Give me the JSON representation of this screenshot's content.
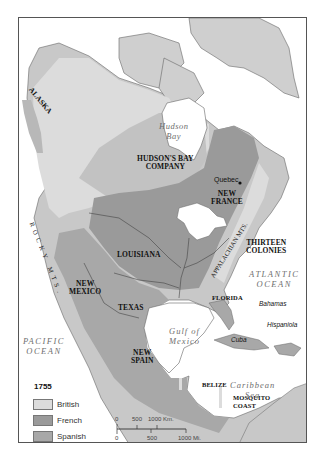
{
  "map": {
    "year": "1755",
    "colors": {
      "water": "#ffffff",
      "british": "#dcdcdc",
      "french": "#9a9a9a",
      "spanish": "#a8a8a8",
      "russian": "#b8b8b8",
      "unclaimed": "#c8c8c8",
      "border": "#555555"
    },
    "territories": {
      "alaska": "ALASKA",
      "hudsons_bay_company_line1": "HUDSON'S BAY",
      "hudsons_bay_company_line2": "COMPANY",
      "new_france_line1": "NEW",
      "new_france_line2": "FRANCE",
      "louisiana": "LOUISIANA",
      "new_mexico_line1": "NEW",
      "new_mexico_line2": "MEXICO",
      "texas": "TEXAS",
      "thirteen_colonies_line1": "THIRTEEN",
      "thirteen_colonies_line2": "COLONIES",
      "florida": "FLORIDA",
      "new_spain_line1": "NEW",
      "new_spain_line2": "SPAIN",
      "belize": "BELIZE",
      "mosquito_coast_line1": "MOSQUITO",
      "mosquito_coast_line2": "COAST"
    },
    "water_bodies": {
      "hudson_bay_line1": "Hudson",
      "hudson_bay_line2": "Bay",
      "atlantic_line1": "ATLANTIC",
      "atlantic_line2": "OCEAN",
      "pacific_line1": "PACIFIC",
      "pacific_line2": "OCEAN",
      "gulf_line1": "Gulf of",
      "gulf_line2": "Mexico",
      "caribbean_line1": "Caribbean",
      "caribbean_line2": "Sea"
    },
    "islands": {
      "bahamas": "Bahamas",
      "hispaniola": "Hispaniola",
      "cuba": "Cuba"
    },
    "cities": {
      "quebec": "Quebec"
    },
    "mountains": {
      "rocky": "ROCKY MTS.",
      "appalachian": "APPALACHIAN MTS."
    }
  },
  "legend": {
    "title": "1755",
    "items": [
      {
        "label": "British",
        "color": "#dcdcdc"
      },
      {
        "label": "French",
        "color": "#9a9a9a"
      },
      {
        "label": "Spanish",
        "color": "#a8a8a8"
      },
      {
        "label": "Russian",
        "color": "#b8b8b8"
      }
    ]
  },
  "scale_bar": {
    "km_ticks": [
      "0",
      "500",
      "1000 Km."
    ],
    "mi_ticks": [
      "0",
      "500",
      "1000 Mi."
    ]
  }
}
